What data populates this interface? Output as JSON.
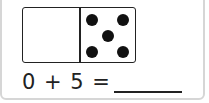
{
  "domino": {
    "left_pips": 0,
    "right_pips": 5,
    "pip_color": "#111111"
  },
  "equation": {
    "text": "0 + 5 =",
    "answer": ""
  }
}
